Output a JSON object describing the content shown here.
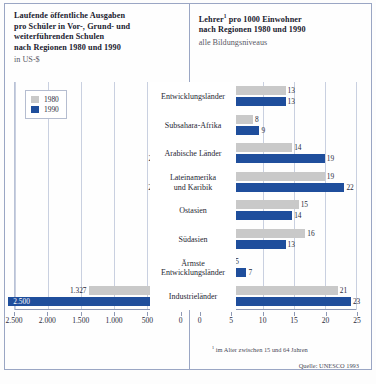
{
  "left_panel": {
    "title_line1": "Laufende öffentliche Ausgaben",
    "title_line2": "pro Schüler in Vor-, Grund- und",
    "title_line3": "weiterführenden Schulen",
    "title_line4": "nach Regionen 1980 und 1990",
    "subtitle": "in US-$",
    "legend": {
      "item1": "1980",
      "item2": "1990"
    }
  },
  "right_panel": {
    "title_line1": "Lehrer",
    "title_line1_sup": "1",
    "title_line1_rest": " pro 1000 Einwohner",
    "title_line2": "nach Regionen 1980 und 1990",
    "subtitle": "alle Bildungsniveaus",
    "footnote_marker": "1",
    "footnote": "im Alter zwischen 15 und 64 Jahren",
    "source": "Quelle: UNESCO 1993"
  },
  "colors": {
    "y1980": "#c9c9c9",
    "y1990": "#1f4e9c",
    "grid": "#c9d0e0",
    "frame": "#9aa6c4"
  },
  "categories": [
    "Entwicklungsländer",
    "Subsahara-Afrika",
    "Arabische Länder",
    "Lateinamerika und Karibik",
    "Ostasien",
    "Südasien",
    "Ärmste Entwicklungsländer",
    "Industrieländer"
  ],
  "chart_data": [
    {
      "type": "bar",
      "orientation": "horizontal-reversed",
      "title": "Laufende öffentliche Ausgaben pro Schüler in Vor-, Grund- und weiterführenden Schulen nach Regionen 1980 und 1990",
      "subtitle": "in US-$",
      "xlabel": "in US-$",
      "ylabel": "",
      "xlim": [
        0,
        2500
      ],
      "xticks": [
        2500,
        2000,
        1500,
        1000,
        500,
        0
      ],
      "xticklabels": [
        "2.500",
        "2.000",
        "1.500",
        "1.000",
        "500",
        "0"
      ],
      "grid": true,
      "legend": [
        "1980",
        "1990"
      ],
      "legend_position": "top-left",
      "categories": [
        "Entwicklungsländer",
        "Subsahara-Afrika",
        "Arabische Länder",
        "Lateinamerika und Karibik",
        "Ostasien",
        "Südasien",
        "Ärmste Entwicklungsländer",
        "Industrieländer"
      ],
      "series": [
        {
          "name": "1980",
          "values": [
            67,
            62,
            170,
            165,
            32,
            62,
            28,
            1327
          ],
          "labels": [
            "67",
            "62",
            "170",
            "165",
            "32",
            "62",
            "28",
            "1.327"
          ]
        },
        {
          "name": "1990",
          "values": [
            122,
            58,
            263,
            267,
            76,
            104,
            34,
            2500
          ],
          "labels": [
            "122",
            "58",
            "263",
            "267",
            "76",
            "104",
            "34",
            "2.500"
          ]
        }
      ]
    },
    {
      "type": "bar",
      "orientation": "horizontal",
      "title": "Lehrer¹ pro 1000 Einwohner nach Regionen 1980 und 1990",
      "subtitle": "alle Bildungsniveaus",
      "xlabel": "",
      "ylabel": "",
      "xlim": [
        0,
        25
      ],
      "xticks": [
        0,
        5,
        10,
        15,
        20,
        25
      ],
      "xticklabels": [
        "0",
        "5",
        "10",
        "15",
        "20",
        "25"
      ],
      "grid": true,
      "legend": [
        "1980",
        "1990"
      ],
      "annotation": "¹ im Alter zwischen 15 und 64 Jahren",
      "source": "Quelle: UNESCO 1993",
      "categories": [
        "Entwicklungsländer",
        "Subsahara-Afrika",
        "Arabische Länder",
        "Lateinamerika und Karibik",
        "Ostasien",
        "Südasien",
        "Ärmste Entwicklungsländer",
        "Industrieländer"
      ],
      "series": [
        {
          "name": "1980",
          "values": [
            13,
            8,
            14,
            19,
            15,
            16,
            5,
            21
          ],
          "labels": [
            "13",
            "8",
            "14",
            "19",
            "15",
            "16",
            "5",
            "21"
          ]
        },
        {
          "name": "1990",
          "values": [
            13,
            9,
            19,
            22,
            14,
            13,
            7,
            23
          ],
          "labels": [
            "13",
            "9",
            "19",
            "22",
            "14",
            "13",
            "7",
            "23"
          ]
        }
      ]
    }
  ]
}
